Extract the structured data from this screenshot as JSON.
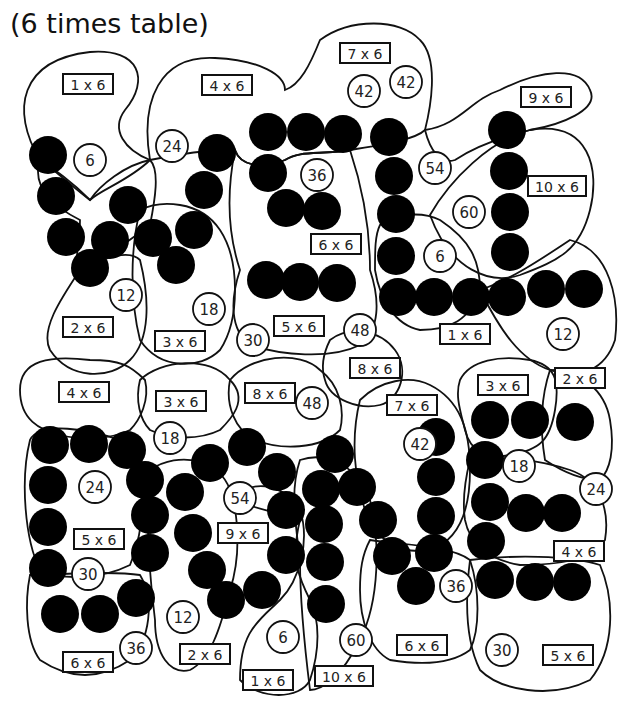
{
  "title": "(6 times table)",
  "colors": {
    "ink": "#111111",
    "dot": "#000000",
    "background": "#ffffff"
  },
  "regions": [
    "M40,160 C10,110 20,60 90,52 C140,48 150,80 125,110 C110,130 125,150 150,160 C130,180 100,190 90,200 C70,180 55,170 40,160 Z",
    "M150,160 C140,100 160,55 215,58 C260,60 285,75 285,90 C300,85 310,65 320,40 C350,18 400,18 420,40 C440,60 430,110 425,130 C415,140 380,145 350,150 C320,155 300,150 285,160 C260,170 240,165 235,150 C220,150 200,150 150,160 Z",
    "M425,130 C460,125 470,100 500,90 C540,70 580,65 590,90 C600,110 560,125 530,130 C490,140 470,150 455,160 C440,165 430,150 425,130 Z",
    "M430,215 C450,180 490,140 530,130 C590,120 600,170 590,210 C580,250 560,260 520,275 C490,285 450,270 430,215 Z",
    "M40,160 C30,190 60,210 80,220 C80,250 70,270 85,270 C110,255 130,240 150,225 C155,200 160,170 150,160 C125,165 100,185 90,200 C70,185 55,170 40,160 Z",
    "M80,270 C60,300 40,330 50,350 C70,380 110,380 130,360 C150,340 150,300 140,260 C130,250 110,255 80,270 Z",
    "M140,210 C160,200 200,200 220,230 C240,260 240,320 220,350 C200,370 160,370 140,340 C130,300 130,250 140,210 Z",
    "M235,150 C240,165 260,170 285,160 C300,150 320,155 350,150 C360,180 370,220 370,270 C380,300 380,330 360,345 C330,360 280,355 250,345 C230,330 230,300 240,270 C230,240 225,200 235,150 Z",
    "M380,225 C390,215 420,210 440,220 C470,240 480,260 480,290 C470,320 450,330 420,330 C395,325 380,300 375,270 C375,250 375,235 380,225 Z",
    "M480,290 C510,280 540,260 570,240 C610,250 620,300 615,340 C605,370 580,380 550,370 C520,360 500,330 480,290 Z",
    "M330,340 C350,325 380,330 395,350 C410,370 400,400 380,405 C360,410 330,400 325,380 C320,365 325,350 330,340 Z",
    "M20,390 C20,360 50,355 90,360 C120,360 130,365 145,380 C150,400 140,420 130,430 C110,440 80,440 60,435 C40,430 20,420 20,390 Z",
    "M140,380 C160,360 210,355 230,380 C250,400 230,420 220,430 C200,440 170,440 150,430 C140,420 135,400 140,380 Z",
    "M230,380 C250,355 300,350 320,370 C340,385 345,410 340,430 C320,450 280,450 255,440 C235,430 225,405 230,380 Z",
    "M360,400 C380,380 410,375 430,385 C460,400 470,430 470,470 C470,510 460,540 430,550 C400,555 375,540 365,510 C355,480 350,440 360,400 Z",
    "M460,380 C470,360 500,355 530,360 C555,365 560,380 555,410 C550,440 540,450 510,455 C485,460 470,450 465,430 C460,410 455,395 460,380 Z",
    "M550,370 C580,370 605,390 610,420 C615,450 610,470 600,480 C580,480 560,470 545,460 C540,430 540,400 550,370 Z",
    "M30,440 C40,420 90,430 120,440 C140,450 150,470 140,490 C145,510 140,540 130,565 C100,580 60,580 40,570 C25,540 20,480 30,440 Z",
    "M30,575 C60,575 110,570 140,575 C155,600 150,640 130,660 C100,680 70,680 40,660 C25,640 25,600 30,575 Z",
    "M150,470 C180,450 220,460 230,490 C240,520 240,560 230,590 C220,630 210,660 190,670 C170,675 155,655 155,620 C150,580 145,520 150,470 Z",
    "M230,500 C250,480 280,480 300,510 C310,540 300,580 280,600 C260,620 240,630 240,680 C260,700 300,700 310,680 C320,650 320,620 310,600 C300,580 290,560 300,520 Z",
    "M300,460 C330,450 360,470 370,500 C380,540 380,600 360,640 C340,680 320,690 310,690 C305,650 300,600 300,560 C295,520 290,490 300,460 Z",
    "M370,540 C400,545 450,545 470,560 C480,590 480,630 470,650 C450,665 420,665 390,660 C370,650 360,620 360,590 C360,570 362,555 370,540 Z",
    "M470,560 C510,555 570,555 600,565 C615,600 615,650 590,680 C550,700 500,690 480,670 C465,640 465,600 470,560 Z",
    "M470,460 C500,455 540,460 570,470 C600,480 610,510 605,540 C590,560 560,565 520,565 C490,560 470,545 465,520 C462,500 465,480 470,460 Z"
  ],
  "dots": [
    [
      48,
      155
    ],
    [
      56,
      196
    ],
    [
      66,
      237
    ],
    [
      90,
      268
    ],
    [
      110,
      240
    ],
    [
      128,
      205
    ],
    [
      153,
      238
    ],
    [
      176,
      265
    ],
    [
      194,
      230
    ],
    [
      204,
      190
    ],
    [
      217,
      153
    ],
    [
      268,
      132
    ],
    [
      306,
      132
    ],
    [
      343,
      134
    ],
    [
      389,
      137
    ],
    [
      268,
      173
    ],
    [
      286,
      208
    ],
    [
      322,
      211
    ],
    [
      266,
      280
    ],
    [
      300,
      282
    ],
    [
      337,
      283
    ],
    [
      394,
      176
    ],
    [
      396,
      214
    ],
    [
      396,
      256
    ],
    [
      398,
      297
    ],
    [
      434,
      297
    ],
    [
      471,
      297
    ],
    [
      507,
      297
    ],
    [
      546,
      289
    ],
    [
      584,
      289
    ],
    [
      507,
      130
    ],
    [
      509,
      171
    ],
    [
      510,
      212
    ],
    [
      510,
      252
    ],
    [
      50,
      445
    ],
    [
      89,
      444
    ],
    [
      127,
      450
    ],
    [
      48,
      485
    ],
    [
      48,
      527
    ],
    [
      48,
      568
    ],
    [
      60,
      614
    ],
    [
      100,
      614
    ],
    [
      136,
      598
    ],
    [
      150,
      553
    ],
    [
      150,
      515
    ],
    [
      145,
      480
    ],
    [
      185,
      492
    ],
    [
      210,
      463
    ],
    [
      193,
      533
    ],
    [
      207,
      570
    ],
    [
      226,
      600
    ],
    [
      262,
      590
    ],
    [
      247,
      447
    ],
    [
      277,
      472
    ],
    [
      286,
      510
    ],
    [
      286,
      555
    ],
    [
      335,
      454
    ],
    [
      321,
      489
    ],
    [
      357,
      487
    ],
    [
      324,
      524
    ],
    [
      325,
      562
    ],
    [
      326,
      604
    ],
    [
      378,
      520
    ],
    [
      392,
      556
    ],
    [
      434,
      553
    ],
    [
      416,
      586
    ],
    [
      436,
      437
    ],
    [
      436,
      477
    ],
    [
      436,
      516
    ],
    [
      490,
      420
    ],
    [
      530,
      420
    ],
    [
      575,
      422
    ],
    [
      485,
      460
    ],
    [
      490,
      502
    ],
    [
      526,
      513
    ],
    [
      562,
      513
    ],
    [
      486,
      541
    ],
    [
      495,
      580
    ],
    [
      535,
      582
    ],
    [
      572,
      582
    ]
  ],
  "numbers": [
    {
      "x": 90,
      "y": 160,
      "v": "6"
    },
    {
      "x": 172,
      "y": 146,
      "v": "24"
    },
    {
      "x": 364,
      "y": 91,
      "v": "42"
    },
    {
      "x": 406,
      "y": 82,
      "v": "42"
    },
    {
      "x": 317,
      "y": 175,
      "v": "36"
    },
    {
      "x": 435,
      "y": 168,
      "v": "54"
    },
    {
      "x": 469,
      "y": 212,
      "v": "60"
    },
    {
      "x": 440,
      "y": 256,
      "v": "6"
    },
    {
      "x": 126,
      "y": 295
    },
    {
      "x": 209,
      "y": 309
    },
    {
      "x": 253,
      "y": 340
    },
    {
      "x": 360,
      "y": 330
    },
    {
      "x": 563,
      "y": 334
    },
    {
      "x": 170,
      "y": 438
    },
    {
      "x": 312,
      "y": 403
    },
    {
      "x": 420,
      "y": 444
    },
    {
      "x": 95,
      "y": 487
    },
    {
      "x": 519,
      "y": 466
    },
    {
      "x": 240,
      "y": 498
    },
    {
      "x": 596,
      "y": 489
    },
    {
      "x": 88,
      "y": 574
    },
    {
      "x": 183,
      "y": 617
    },
    {
      "x": 136,
      "y": 648
    },
    {
      "x": 283,
      "y": 637
    },
    {
      "x": 356,
      "y": 640
    },
    {
      "x": 456,
      "y": 586
    },
    {
      "x": 502,
      "y": 650
    }
  ],
  "number_values": [
    "6",
    "24",
    "42",
    "42",
    "36",
    "54",
    "60",
    "6",
    "12",
    "18",
    "30",
    "48",
    "12",
    "18",
    "48",
    "42",
    "24",
    "18",
    "54",
    "24",
    "30",
    "12",
    "36",
    "6",
    "60",
    "36",
    "30"
  ],
  "labels": [
    {
      "x": 88,
      "y": 84,
      "t": "1 x 6"
    },
    {
      "x": 227,
      "y": 85,
      "t": "4 x 6"
    },
    {
      "x": 365,
      "y": 53,
      "t": "7 x 6"
    },
    {
      "x": 546,
      "y": 97,
      "t": "9 x 6"
    },
    {
      "x": 557,
      "y": 186,
      "t": "10 x 6"
    },
    {
      "x": 336,
      "y": 244,
      "t": "6 x 6"
    },
    {
      "x": 465,
      "y": 334,
      "t": "1 x 6"
    },
    {
      "x": 88,
      "y": 327,
      "t": "2 x 6"
    },
    {
      "x": 180,
      "y": 341,
      "t": "3 x 6"
    },
    {
      "x": 299,
      "y": 326,
      "t": "5 x 6"
    },
    {
      "x": 375,
      "y": 368,
      "t": "8 x 6"
    },
    {
      "x": 84,
      "y": 392,
      "t": "4 x 6"
    },
    {
      "x": 181,
      "y": 401,
      "t": "3 x 6"
    },
    {
      "x": 270,
      "y": 393,
      "t": "8 x 6"
    },
    {
      "x": 412,
      "y": 405,
      "t": "7 x 6"
    },
    {
      "x": 503,
      "y": 385,
      "t": "3 x 6"
    },
    {
      "x": 580,
      "y": 378,
      "t": "2 x 6"
    },
    {
      "x": 99,
      "y": 539,
      "t": "5 x 6"
    },
    {
      "x": 243,
      "y": 533,
      "t": "9 x 6"
    },
    {
      "x": 579,
      "y": 551,
      "t": "4 x 6"
    },
    {
      "x": 88,
      "y": 662,
      "t": "6 x 6"
    },
    {
      "x": 205,
      "y": 654,
      "t": "2 x 6"
    },
    {
      "x": 268,
      "y": 680,
      "t": "1 x 6"
    },
    {
      "x": 344,
      "y": 676,
      "t": "10 x 6"
    },
    {
      "x": 422,
      "y": 645,
      "t": "6 x 6"
    },
    {
      "x": 568,
      "y": 655,
      "t": "5 x 6"
    }
  ]
}
